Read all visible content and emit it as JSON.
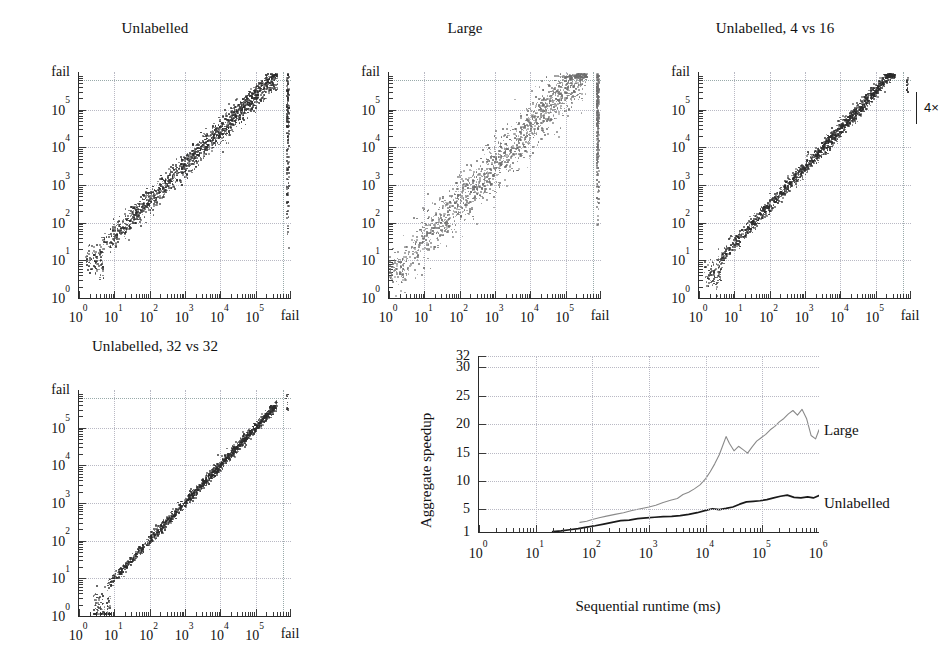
{
  "figure": {
    "kind": "multi-panel scientific figure",
    "panels": [
      "Unlabelled",
      "Large",
      "Unlabelled, 4 vs 16",
      "Unlabelled, 32 vs 32",
      "Aggregate speedup"
    ]
  },
  "chart_data": [
    {
      "type": "scatter",
      "title": "Unlabelled",
      "xlabel": "",
      "ylabel": "",
      "xscale": "log",
      "yscale": "log",
      "xticks": [
        "10^0",
        "10^1",
        "10^2",
        "10^3",
        "10^4",
        "10^5",
        "fail"
      ],
      "yticks": [
        "10^0",
        "10^1",
        "10^2",
        "10^3",
        "10^4",
        "10^5",
        "fail"
      ],
      "xtick_labels": [
        "10",
        "10",
        "10",
        "10",
        "10",
        "10",
        "fail"
      ],
      "xtick_exponents": [
        "0",
        "1",
        "2",
        "3",
        "4",
        "5",
        ""
      ],
      "ytick_labels": [
        "10",
        "10",
        "10",
        "10",
        "10",
        "10",
        "fail"
      ],
      "ytick_exponents": [
        "0",
        "1",
        "2",
        "3",
        "4",
        "5",
        ""
      ],
      "xlim": [
        0,
        6
      ],
      "ylim": [
        0,
        6
      ],
      "grid": true,
      "point_color": "#2b2b2b",
      "n_points": 1500,
      "cloud": {
        "x_min_decade": 0.55,
        "x_max_decade": 5.62,
        "slope": 0.93,
        "intercept_decade": 0.72,
        "spread": 0.17,
        "fail_column": true,
        "fail_column_density": 0.55
      }
    },
    {
      "type": "scatter",
      "title": "Large",
      "xlabel": "",
      "ylabel": "",
      "xscale": "log",
      "yscale": "log",
      "xtick_labels": [
        "10",
        "10",
        "10",
        "10",
        "10",
        "10",
        "fail"
      ],
      "xtick_exponents": [
        "0",
        "1",
        "2",
        "3",
        "4",
        "5",
        ""
      ],
      "ytick_labels": [
        "10",
        "10",
        "10",
        "10",
        "10",
        "10",
        "fail"
      ],
      "ytick_exponents": [
        "0",
        "1",
        "2",
        "3",
        "4",
        "5",
        ""
      ],
      "xlim": [
        0,
        6
      ],
      "ylim": [
        0,
        6
      ],
      "grid": true,
      "point_color": "#6d6d6d",
      "n_points": 1500,
      "cloud": {
        "x_min_decade": 0.35,
        "x_max_decade": 5.6,
        "slope": 1.0,
        "intercept_decade": 0.55,
        "spread": 0.33,
        "fail_column": true,
        "fail_column_density": 0.95
      }
    },
    {
      "type": "scatter",
      "title": "Unlabelled, 4 vs 16",
      "xlabel": "",
      "ylabel": "",
      "xscale": "log",
      "yscale": "log",
      "xtick_labels": [
        "10",
        "10",
        "10",
        "10",
        "10",
        "10",
        "fail"
      ],
      "xtick_exponents": [
        "0",
        "1",
        "2",
        "3",
        "4",
        "5",
        ""
      ],
      "ytick_labels": [
        "10",
        "10",
        "10",
        "10",
        "10",
        "10",
        "fail"
      ],
      "ytick_exponents": [
        "0",
        "1",
        "2",
        "3",
        "4",
        "5",
        ""
      ],
      "xlim": [
        0,
        6
      ],
      "ylim": [
        0,
        6
      ],
      "grid": true,
      "point_color": "#2b2b2b",
      "n_points": 1500,
      "annotation": "4×",
      "cloud": {
        "x_min_decade": 0.5,
        "x_max_decade": 5.55,
        "slope": 1.02,
        "intercept_decade": 0.4,
        "spread": 0.1,
        "fail_column": false,
        "fail_column_density": 0
      }
    },
    {
      "type": "scatter",
      "title": "Unlabelled, 32 vs 32",
      "xlabel": "",
      "ylabel": "",
      "xscale": "log",
      "yscale": "log",
      "xtick_labels": [
        "10",
        "10",
        "10",
        "10",
        "10",
        "10",
        "fail"
      ],
      "xtick_exponents": [
        "0",
        "1",
        "2",
        "3",
        "4",
        "5",
        ""
      ],
      "ytick_labels": [
        "10",
        "10",
        "10",
        "10",
        "10",
        "10",
        "fail"
      ],
      "ytick_exponents": [
        "0",
        "1",
        "2",
        "3",
        "4",
        "5",
        ""
      ],
      "xlim": [
        0,
        6
      ],
      "ylim": [
        0,
        6
      ],
      "grid": true,
      "point_color": "#2b2b2b",
      "n_points": 1400,
      "cloud": {
        "x_min_decade": 0.75,
        "x_max_decade": 5.6,
        "slope": 1.0,
        "intercept_decade": 0.0,
        "spread": 0.07,
        "fail_column": false,
        "fail_column_density": 0
      }
    },
    {
      "type": "line",
      "title": "",
      "xlabel": "Sequential runtime (ms)",
      "ylabel": "Aggregate speedup",
      "xscale": "log",
      "yscale": "linear",
      "xtick_labels": [
        "10",
        "10",
        "10",
        "10",
        "10",
        "10",
        "10"
      ],
      "xtick_exponents": [
        "0",
        "1",
        "2",
        "3",
        "4",
        "5",
        "6"
      ],
      "ytick_labels": [
        "1",
        "5",
        "10",
        "15",
        "20",
        "25",
        "30",
        "32"
      ],
      "ytick_values": [
        1,
        5,
        10,
        15,
        20,
        25,
        30,
        32
      ],
      "xlim": [
        0,
        6
      ],
      "ylim": [
        1,
        32
      ],
      "grid": true,
      "legend_position": "right-inline",
      "series": [
        {
          "name": "Large",
          "color": "#8a8a8a",
          "x": [
            1.78,
            1.9,
            2.0,
            2.12,
            2.25,
            2.4,
            2.55,
            2.7,
            2.85,
            3.0,
            3.12,
            3.25,
            3.38,
            3.5,
            3.6,
            3.7,
            3.8,
            3.9,
            4.0,
            4.08,
            4.16,
            4.24,
            4.3,
            4.36,
            4.42,
            4.5,
            4.58,
            4.66,
            4.74,
            4.82,
            4.9,
            4.98,
            5.06,
            5.14,
            5.22,
            5.3,
            5.38,
            5.46,
            5.54,
            5.62,
            5.7,
            5.78,
            5.86,
            5.94,
            6.0
          ],
          "values": [
            2.7,
            2.9,
            3.2,
            3.5,
            3.8,
            4.1,
            4.4,
            4.8,
            5.1,
            5.4,
            5.7,
            6.2,
            6.6,
            6.9,
            7.6,
            8.0,
            8.6,
            9.3,
            10.4,
            11.6,
            13.0,
            14.6,
            16.2,
            17.8,
            16.6,
            15.3,
            16.1,
            15.5,
            14.9,
            16.0,
            17.0,
            17.6,
            18.2,
            19.0,
            19.6,
            20.4,
            21.0,
            21.8,
            22.4,
            21.6,
            22.6,
            21.0,
            18.0,
            17.4,
            19.0
          ]
        },
        {
          "name": "Unlabelled",
          "color": "#1a1a1a",
          "x": [
            1.3,
            1.45,
            1.6,
            1.75,
            1.9,
            2.05,
            2.2,
            2.35,
            2.5,
            2.65,
            2.8,
            2.95,
            3.1,
            3.25,
            3.4,
            3.55,
            3.7,
            3.85,
            4.0,
            4.12,
            4.24,
            4.36,
            4.48,
            4.6,
            4.72,
            4.84,
            4.96,
            5.08,
            5.2,
            5.32,
            5.44,
            5.56,
            5.68,
            5.8,
            5.9,
            6.0
          ],
          "values": [
            1.05,
            1.2,
            1.4,
            1.6,
            1.85,
            2.1,
            2.4,
            2.7,
            3.0,
            3.1,
            3.35,
            3.5,
            3.6,
            3.7,
            3.75,
            3.9,
            4.1,
            4.4,
            4.8,
            5.1,
            4.95,
            5.15,
            5.4,
            5.9,
            6.3,
            6.4,
            6.5,
            6.7,
            7.0,
            7.3,
            7.5,
            7.1,
            7.0,
            7.2,
            7.0,
            7.4
          ]
        }
      ]
    }
  ],
  "panel1": {
    "title": "Unlabelled",
    "axis_fail_label": "fail"
  },
  "panel2": {
    "title": "Large",
    "axis_fail_label": "fail"
  },
  "panel3": {
    "title": "Unlabelled, 4 vs 16",
    "axis_fail_label": "fail",
    "annotation": "4×"
  },
  "panel4": {
    "title": "Unlabelled, 32 vs 32",
    "axis_fail_label": "fail"
  },
  "panel5": {
    "ylabel": "Aggregate speedup",
    "xlabel": "Sequential runtime (ms)",
    "series_label_large": "Large",
    "series_label_unlabelled": "Unlabelled"
  }
}
